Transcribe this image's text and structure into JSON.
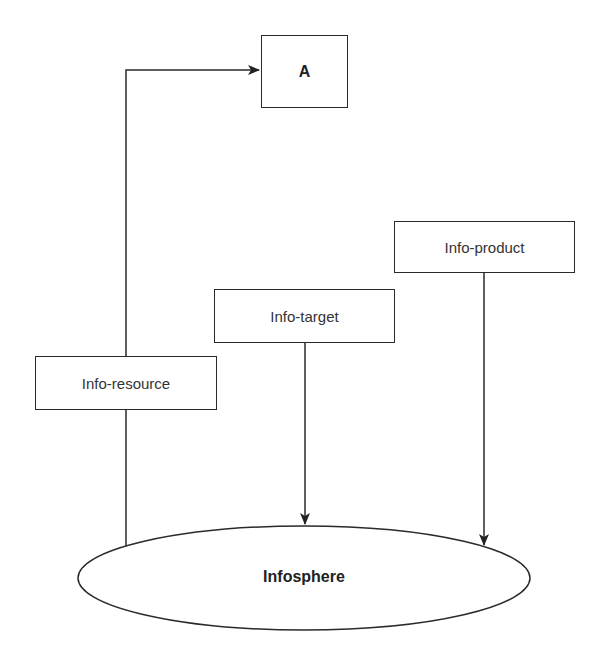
{
  "nodes": {
    "a": {
      "label": "A"
    },
    "info_resource": {
      "label": "Info-resource"
    },
    "info_target": {
      "label": "Info-target"
    },
    "info_product": {
      "label": "Info-product"
    },
    "infosphere": {
      "label": "Infosphere"
    }
  },
  "edges": [
    {
      "from": "info_resource",
      "to": "a"
    },
    {
      "from": "infosphere",
      "to": "info_resource"
    },
    {
      "from": "info_target",
      "to": "infosphere"
    },
    {
      "from": "info_product",
      "to": "infosphere"
    }
  ]
}
